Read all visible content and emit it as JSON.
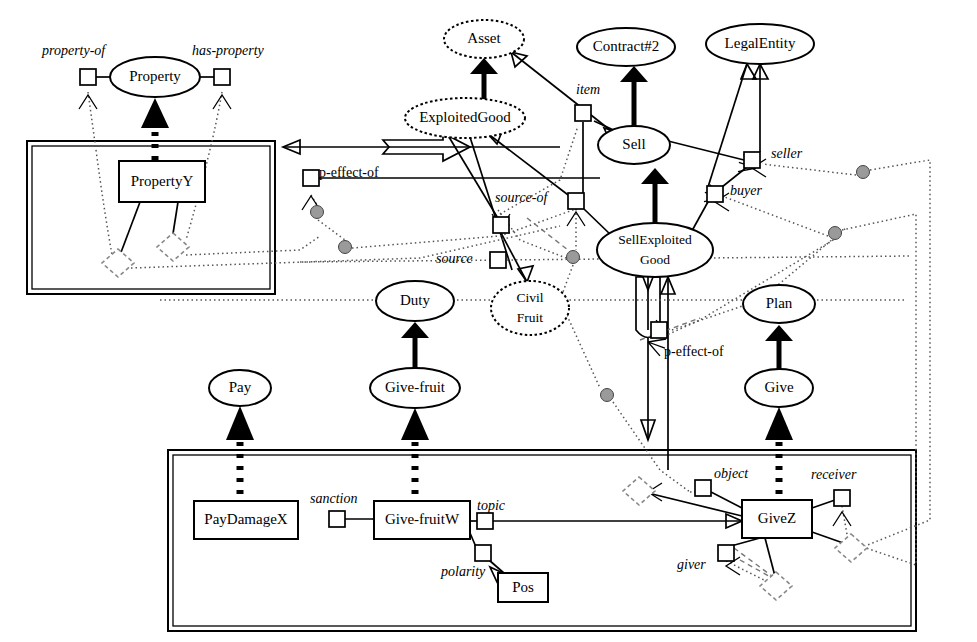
{
  "diagram": {
    "type": "node-link-diagram",
    "width": 977,
    "height": 642,
    "colors": {
      "stroke": "#000000",
      "background": "#ffffff",
      "grey_node": "#9a9a9a",
      "dashed_grey": "#777777"
    },
    "containers": [
      {
        "name": "upper-left-frame",
        "x": 27,
        "y": 141,
        "w": 248,
        "h": 153
      },
      {
        "name": "lower-frame",
        "x": 168,
        "y": 450,
        "w": 748,
        "h": 181
      }
    ],
    "concept_nodes": [
      {
        "id": "property",
        "label": "Property",
        "shape": "ellipse",
        "cx": 155,
        "cy": 77,
        "rx": 45,
        "ry": 20
      },
      {
        "id": "asset",
        "label": "Asset",
        "shape": "ellipse-dotted",
        "cx": 484,
        "cy": 39,
        "rx": 40,
        "ry": 19
      },
      {
        "id": "contract2",
        "label": "Contract#2",
        "shape": "ellipse",
        "cx": 626,
        "cy": 47,
        "rx": 49,
        "ry": 19
      },
      {
        "id": "legalentity",
        "label": "LegalEntity",
        "shape": "ellipse",
        "cx": 760,
        "cy": 44,
        "rx": 54,
        "ry": 20
      },
      {
        "id": "exploitedgood",
        "label": "ExploitedGood",
        "shape": "ellipse-dotted",
        "cx": 465,
        "cy": 118,
        "rx": 60,
        "ry": 20
      },
      {
        "id": "sell",
        "label": "Sell",
        "shape": "ellipse",
        "cx": 634,
        "cy": 145,
        "rx": 36,
        "ry": 19
      },
      {
        "id": "sellexploited",
        "label": "SellExploited",
        "label2": "Good",
        "shape": "ellipse",
        "cx": 655,
        "cy": 250,
        "rx": 58,
        "ry": 27
      },
      {
        "id": "civilfruit",
        "label": "Civil",
        "label2": "Fruit",
        "shape": "ellipse-dotted",
        "cx": 530,
        "cy": 308,
        "rx": 39,
        "ry": 27
      },
      {
        "id": "duty",
        "label": "Duty",
        "shape": "ellipse",
        "cx": 415,
        "cy": 301,
        "rx": 39,
        "ry": 20
      },
      {
        "id": "givefruit",
        "label": "Give-fruit",
        "shape": "ellipse",
        "cx": 415,
        "cy": 388,
        "rx": 45,
        "ry": 20
      },
      {
        "id": "pay",
        "label": "Pay",
        "shape": "ellipse",
        "cx": 240,
        "cy": 388,
        "rx": 31,
        "ry": 18
      },
      {
        "id": "plan",
        "label": "Plan",
        "shape": "ellipse",
        "cx": 779,
        "cy": 304,
        "rx": 36,
        "ry": 19
      },
      {
        "id": "give",
        "label": "Give",
        "shape": "ellipse",
        "cx": 779,
        "cy": 388,
        "rx": 34,
        "ry": 19
      }
    ],
    "instance_nodes": [
      {
        "id": "propertyY",
        "label": "PropertyY",
        "shape": "rect",
        "x": 119,
        "y": 161,
        "w": 86,
        "h": 41
      },
      {
        "id": "paydamageX",
        "label": "PayDamageX",
        "shape": "rect",
        "x": 194,
        "y": 501,
        "w": 104,
        "h": 38
      },
      {
        "id": "givefruitW",
        "label": "Give-fruitW",
        "shape": "rect",
        "x": 374,
        "y": 501,
        "w": 96,
        "h": 38
      },
      {
        "id": "giveZ",
        "label": "GiveZ",
        "shape": "rect",
        "x": 742,
        "y": 500,
        "w": 70,
        "h": 38
      },
      {
        "id": "pos",
        "label": "Pos",
        "shape": "rect",
        "x": 498,
        "y": 573,
        "w": 50,
        "h": 29
      }
    ],
    "role_labels": [
      {
        "id": "property-of",
        "text": "property-of",
        "x": 42,
        "y": 55,
        "style": "italic"
      },
      {
        "id": "has-property",
        "text": "has-property",
        "x": 192,
        "y": 55,
        "style": "italic"
      },
      {
        "id": "item",
        "text": "item",
        "x": 576,
        "y": 94,
        "style": "italic"
      },
      {
        "id": "seller",
        "text": "seller",
        "x": 771,
        "y": 158,
        "style": "italic"
      },
      {
        "id": "buyer",
        "text": "buyer",
        "x": 730,
        "y": 195,
        "style": "italic"
      },
      {
        "id": "p-effect-of-1",
        "text": "p-effect-of",
        "x": 319,
        "y": 177,
        "style": "plain"
      },
      {
        "id": "source-of",
        "text": "source-of",
        "x": 495,
        "y": 202,
        "style": "italic"
      },
      {
        "id": "source",
        "text": "source",
        "x": 436,
        "y": 263,
        "style": "italic"
      },
      {
        "id": "p-effect-of-2",
        "text": "p-effect-of",
        "x": 664,
        "y": 356,
        "style": "plain"
      },
      {
        "id": "sanction",
        "text": "sanction",
        "x": 310,
        "y": 503,
        "style": "italic"
      },
      {
        "id": "topic",
        "text": "topic",
        "x": 477,
        "y": 510,
        "style": "italic"
      },
      {
        "id": "polarity",
        "text": "polarity",
        "x": 441,
        "y": 576,
        "style": "italic"
      },
      {
        "id": "object",
        "text": "object",
        "x": 714,
        "y": 478,
        "style": "italic"
      },
      {
        "id": "receiver",
        "text": "receiver",
        "x": 811,
        "y": 479,
        "style": "italic"
      },
      {
        "id": "giver",
        "text": "giver",
        "x": 677,
        "y": 569,
        "style": "italic"
      }
    ],
    "ports": [
      {
        "id": "port-property-of",
        "cx": 88,
        "cy": 77
      },
      {
        "id": "port-has-property",
        "cx": 222,
        "cy": 77
      },
      {
        "id": "port-item",
        "cx": 583,
        "cy": 113
      },
      {
        "id": "port-seller",
        "cx": 752,
        "cy": 160
      },
      {
        "id": "port-buyer",
        "cx": 715,
        "cy": 194
      },
      {
        "id": "port-peffect1",
        "cx": 311,
        "cy": 178
      },
      {
        "id": "port-sourceof",
        "cx": 576,
        "cy": 201
      },
      {
        "id": "port-src1",
        "cx": 501,
        "cy": 225
      },
      {
        "id": "port-src2",
        "cx": 498,
        "cy": 260
      },
      {
        "id": "port-peffect2",
        "cx": 659,
        "cy": 330
      },
      {
        "id": "port-sanction",
        "cx": 337,
        "cy": 519
      },
      {
        "id": "port-topic",
        "cx": 485,
        "cy": 521
      },
      {
        "id": "port-polarity",
        "cx": 483,
        "cy": 553
      },
      {
        "id": "port-object",
        "cx": 703,
        "cy": 488
      },
      {
        "id": "port-receiver",
        "cx": 842,
        "cy": 498
      },
      {
        "id": "port-giver",
        "cx": 726,
        "cy": 553
      }
    ],
    "grey_circles": [
      {
        "id": "grey-1",
        "cx": 317,
        "cy": 212
      },
      {
        "id": "grey-2",
        "cx": 345,
        "cy": 247
      },
      {
        "id": "grey-3",
        "cx": 573,
        "cy": 257
      },
      {
        "id": "grey-4",
        "cx": 607,
        "cy": 395
      },
      {
        "id": "grey-5",
        "cx": 863,
        "cy": 172
      },
      {
        "id": "grey-6",
        "cx": 835,
        "cy": 233
      }
    ],
    "diamonds": [
      {
        "id": "diamond-1",
        "cx": 118,
        "cy": 263
      },
      {
        "id": "diamond-2",
        "cx": 173,
        "cy": 247
      },
      {
        "id": "diamond-3",
        "cx": 639,
        "cy": 491
      },
      {
        "id": "diamond-4",
        "cx": 851,
        "cy": 548
      },
      {
        "id": "diamond-5",
        "cx": 776,
        "cy": 586
      }
    ],
    "isa_links": [
      {
        "from": "propertyY",
        "to": "property",
        "style": "square-dashed-thick"
      },
      {
        "from": "exploitedgood",
        "to": "asset",
        "style": "solid-thick-triangle"
      },
      {
        "from": "sellexploited",
        "to": "sell",
        "style": "solid-thick-triangle"
      },
      {
        "from": "sell",
        "to": "contract2",
        "style": "solid-thick-triangle"
      },
      {
        "from": "givefruit",
        "to": "duty",
        "style": "solid-thick-triangle"
      },
      {
        "from": "give",
        "to": "plan",
        "style": "solid-thick-triangle"
      },
      {
        "from": "givefruitW",
        "to": "givefruit",
        "style": "square-dashed-thick"
      },
      {
        "from": "paydamageX",
        "to": "pay",
        "style": "square-dashed-thick"
      },
      {
        "from": "giveZ",
        "to": "give",
        "style": "square-dashed-thick"
      }
    ]
  }
}
